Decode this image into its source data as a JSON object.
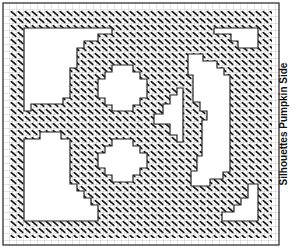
{
  "title": "Silhouettes Pumpkin Side",
  "pattern": {
    "type": "needlepoint-chart",
    "grid_cell_px": 7,
    "stitch_symbol": "diagonal-slash",
    "colors": {
      "background": "#ffffff",
      "grid_line": "#9a9a9a",
      "stitch": "#111111",
      "outline": "#222222"
    }
  },
  "cutouts": [
    {
      "name": "top-left-corner"
    },
    {
      "name": "bottom-left-corner"
    },
    {
      "name": "top-right-corner"
    },
    {
      "name": "bottom-right-corner"
    },
    {
      "name": "upper-eye"
    },
    {
      "name": "lower-eye"
    },
    {
      "name": "nose"
    },
    {
      "name": "mouth-crescent"
    }
  ]
}
